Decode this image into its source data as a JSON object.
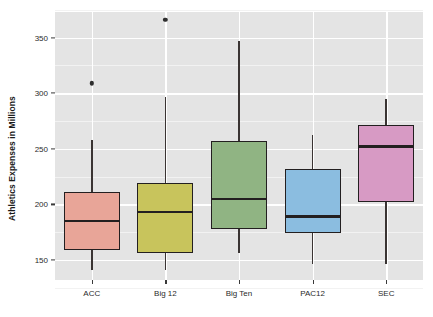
{
  "chart_data": {
    "type": "boxplot",
    "title": "",
    "xlabel": "",
    "ylabel": "Athletics Expenses in Millions",
    "categories": [
      "ACC",
      "Big 12",
      "Big Ten",
      "PAC12",
      "SEC"
    ],
    "ylim": [
      132,
      373
    ],
    "yticks": [
      150,
      200,
      250,
      300,
      350
    ],
    "ytick_labels": [
      "150",
      "200",
      "250",
      "300",
      "350"
    ],
    "grid": true,
    "legend": "none",
    "boxes": [
      {
        "category": "ACC",
        "color": "#e8a598",
        "whisker_low": 141,
        "q1": 159,
        "median": 185,
        "q3": 211,
        "whisker_high": 258,
        "outliers": [
          309
        ]
      },
      {
        "category": "Big 12",
        "color": "#c8c45c",
        "whisker_low": 141,
        "q1": 156,
        "median": 193,
        "q3": 219,
        "whisker_high": 297,
        "outliers": [
          366
        ]
      },
      {
        "category": "Big Ten",
        "color": "#90b483",
        "whisker_low": 156,
        "q1": 178,
        "median": 205,
        "q3": 257,
        "whisker_high": 347,
        "outliers": []
      },
      {
        "category": "PAC12",
        "color": "#8bbde0",
        "whisker_low": 146,
        "q1": 174,
        "median": 189,
        "q3": 232,
        "whisker_high": 262,
        "outliers": []
      },
      {
        "category": "SEC",
        "color": "#d79ac4",
        "whisker_low": 146,
        "q1": 202,
        "median": 252,
        "q3": 271,
        "whisker_high": 295,
        "outliers": []
      }
    ]
  },
  "axis": {
    "y_title": "Athletics Expenses in Millions"
  }
}
